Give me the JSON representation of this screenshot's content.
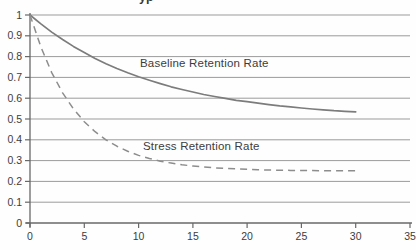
{
  "chart": {
    "title_fragment": "yp",
    "series_labels": {
      "baseline": "Baseline Retention Rate",
      "stress": "Stress Retention Rate"
    }
  },
  "chart_data": {
    "type": "line",
    "title": "",
    "xlabel": "",
    "ylabel": "",
    "xlim": [
      0,
      35
    ],
    "ylim": [
      0,
      1
    ],
    "x_ticks": [
      0,
      5,
      10,
      15,
      20,
      25,
      30,
      35
    ],
    "y_ticks": [
      0,
      0.1,
      0.2,
      0.3,
      0.4,
      0.5,
      0.6,
      0.7,
      0.8,
      0.9,
      1
    ],
    "y_tick_labels": [
      "0",
      "0.1",
      "0.2",
      "0.3",
      "0.4",
      "0.5",
      "0.6",
      "0.7",
      "0.8",
      "0.9",
      "1"
    ],
    "grid": "horizontal",
    "legend": "inline-text-labels",
    "colors": {
      "grid": "#9b9b9b",
      "axis": "#686868",
      "tick_text": "#3c3c3c",
      "baseline_line": "#7c7c7c",
      "stress_line": "#8d8d8d"
    },
    "series": [
      {
        "key": "baseline",
        "name": "Baseline Retention Rate",
        "style": "solid",
        "color": "#7c7c7c",
        "x": [
          0,
          1,
          2,
          3,
          4,
          5,
          6,
          7,
          8,
          9,
          10,
          11,
          12,
          13,
          14,
          15,
          16,
          17,
          18,
          19,
          20,
          21,
          22,
          23,
          24,
          25,
          26,
          27,
          28,
          29,
          30
        ],
        "y": [
          1.0,
          0.957,
          0.918,
          0.882,
          0.849,
          0.819,
          0.791,
          0.766,
          0.743,
          0.722,
          0.703,
          0.686,
          0.67,
          0.655,
          0.642,
          0.63,
          0.618,
          0.608,
          0.599,
          0.59,
          0.583,
          0.576,
          0.569,
          0.563,
          0.558,
          0.553,
          0.548,
          0.544,
          0.54,
          0.537,
          0.534
        ]
      },
      {
        "key": "stress",
        "name": "Stress Retention Rate",
        "style": "dashed",
        "color": "#8d8d8d",
        "x": [
          0,
          1,
          2,
          3,
          4,
          5,
          6,
          7,
          8,
          9,
          10,
          11,
          12,
          13,
          14,
          15,
          16,
          17,
          18,
          19,
          20,
          21,
          22,
          23,
          24,
          25,
          26,
          27,
          28,
          29,
          30
        ],
        "y": [
          1.0,
          0.846,
          0.723,
          0.626,
          0.549,
          0.487,
          0.439,
          0.4,
          0.369,
          0.345,
          0.325,
          0.31,
          0.297,
          0.288,
          0.28,
          0.274,
          0.269,
          0.265,
          0.262,
          0.26,
          0.258,
          0.256,
          0.255,
          0.254,
          0.253,
          0.252,
          0.252,
          0.251,
          0.251,
          0.251,
          0.251
        ]
      }
    ]
  }
}
